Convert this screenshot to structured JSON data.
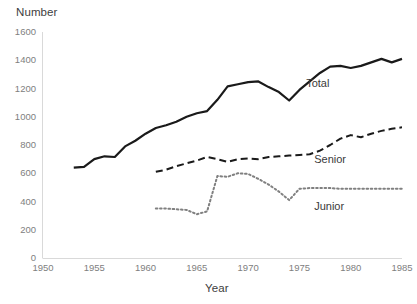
{
  "chart_data": {
    "type": "line",
    "title": "",
    "xlabel": "Year",
    "ylabel": "Number",
    "xlim": [
      1950,
      1985
    ],
    "ylim": [
      0,
      1600
    ],
    "grid": false,
    "legend_position": "inline-right-annotations",
    "x_ticks": [
      "1950",
      "1955",
      "1960",
      "1965",
      "1970",
      "1975",
      "1980",
      "1985"
    ],
    "y_ticks": [
      "0",
      "200",
      "400",
      "600",
      "800",
      "1000",
      "1200",
      "1400",
      "1600"
    ],
    "series": [
      {
        "name": "Total",
        "style": "solid",
        "color": "#1a1a1a",
        "label_text": "Total",
        "x": [
          1953,
          1954,
          1955,
          1956,
          1957,
          1958,
          1959,
          1960,
          1961,
          1962,
          1963,
          1964,
          1965,
          1966,
          1967,
          1968,
          1969,
          1970,
          1971,
          1972,
          1973,
          1974,
          1975,
          1976,
          1977,
          1978,
          1979,
          1980,
          1981,
          1982,
          1983,
          1984,
          1985
        ],
        "values": [
          640,
          645,
          700,
          720,
          715,
          790,
          830,
          880,
          920,
          940,
          965,
          1000,
          1025,
          1040,
          1120,
          1215,
          1230,
          1245,
          1250,
          1210,
          1175,
          1115,
          1190,
          1250,
          1310,
          1355,
          1360,
          1345,
          1360,
          1385,
          1410,
          1385,
          1410
        ]
      },
      {
        "name": "Senior",
        "style": "dashed",
        "color": "#1a1a1a",
        "label_text": "Senior",
        "x": [
          1961,
          1962,
          1963,
          1964,
          1965,
          1966,
          1967,
          1968,
          1969,
          1970,
          1971,
          1972,
          1973,
          1974,
          1975,
          1976,
          1977,
          1978,
          1979,
          1980,
          1981,
          1982,
          1983,
          1984,
          1985
        ],
        "values": [
          610,
          625,
          650,
          670,
          690,
          715,
          700,
          680,
          700,
          705,
          700,
          715,
          720,
          725,
          730,
          735,
          760,
          800,
          845,
          870,
          855,
          880,
          900,
          915,
          925
        ]
      },
      {
        "name": "Junior",
        "style": "dotted",
        "color": "#808080",
        "label_text": "Junior",
        "x": [
          1961,
          1962,
          1963,
          1964,
          1965,
          1966,
          1967,
          1968,
          1969,
          1970,
          1971,
          1972,
          1973,
          1974,
          1975,
          1976,
          1977,
          1978,
          1979,
          1980,
          1981,
          1982,
          1983,
          1984,
          1985
        ],
        "values": [
          350,
          350,
          345,
          340,
          310,
          330,
          580,
          575,
          600,
          595,
          560,
          520,
          470,
          410,
          490,
          495,
          495,
          495,
          490,
          490,
          490,
          490,
          490,
          490,
          490
        ]
      }
    ]
  },
  "axes": {
    "y_title": "Number",
    "x_title": "Year"
  },
  "annotations": {
    "total": "Total",
    "senior": "Senior",
    "junior": "Junior"
  }
}
